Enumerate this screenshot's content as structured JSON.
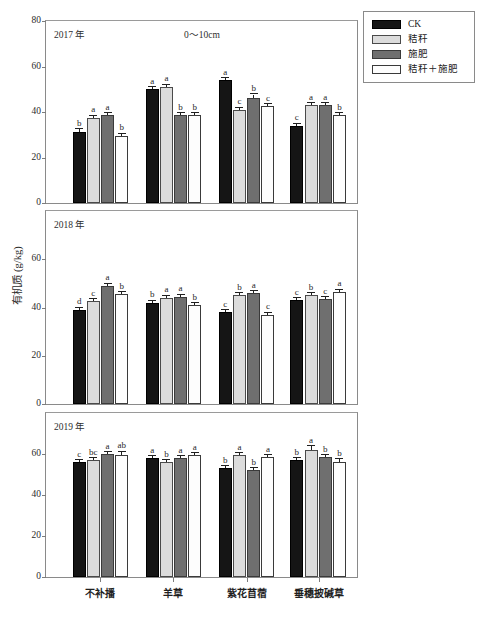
{
  "figure": {
    "ylabel": "有机质 (g/kg)",
    "depth_label": "0～10cm",
    "caption": ""
  },
  "legend": {
    "position": "top-right",
    "items": [
      {
        "label": "CK",
        "swatch": "ck",
        "color": "#151515"
      },
      {
        "label": "秸秆",
        "swatch": "straw",
        "color": "#dcdcdc"
      },
      {
        "label": "施肥",
        "swatch": "fert",
        "color": "#6f6f6f"
      },
      {
        "label": "秸秆＋施肥",
        "swatch": "both",
        "color": "#fdfdfd"
      }
    ]
  },
  "axis": {
    "yticks": [
      "0",
      "20",
      "40",
      "60",
      "80"
    ],
    "ytick_values": [
      0,
      20,
      40,
      60,
      80
    ],
    "ylim": [
      0,
      80
    ],
    "xcategories": [
      "不补播",
      "羊草",
      "紫花苜蓿",
      "垂穗披碱草"
    ]
  },
  "panels": [
    {
      "year": "2017 年",
      "show_80_tick": true
    },
    {
      "year": "2018 年",
      "show_80_tick": false
    },
    {
      "year": "2019 年",
      "show_80_tick": false
    }
  ],
  "chart_data": {
    "type": "bar",
    "title": "0～10cm",
    "xlabel": "",
    "ylabel": "有机质 (g/kg)",
    "ylim": [
      0,
      80
    ],
    "yticks": [
      0,
      20,
      40,
      60,
      80
    ],
    "grid": false,
    "legend_position": "top-right",
    "categories": [
      "不补播",
      "羊草",
      "紫花苜蓿",
      "垂穗披碱草"
    ],
    "panels": [
      {
        "label": "2017 年",
        "series": [
          {
            "name": "CK",
            "values": [
              31.0,
              50.0,
              54.0,
              34.0
            ],
            "errors": [
              1.4,
              0.8,
              0.5,
              0.9
            ],
            "letters": [
              "b",
              "a",
              "a",
              "c"
            ]
          },
          {
            "name": "秸秆",
            "values": [
              37.5,
              51.0,
              41.0,
              43.0
            ],
            "errors": [
              0.5,
              0.6,
              0.7,
              0.6
            ],
            "letters": [
              "a",
              "a",
              "c",
              "a"
            ]
          },
          {
            "name": "施肥",
            "values": [
              38.5,
              38.5,
              46.0,
              43.0
            ],
            "errors": [
              1.0,
              0.8,
              1.7,
              0.4
            ],
            "letters": [
              "a",
              "b",
              "b",
              "a"
            ]
          },
          {
            "name": "秸秆＋施肥",
            "values": [
              29.5,
              38.5,
              42.5,
              38.5
            ],
            "errors": [
              0.9,
              0.3,
              0.6,
              0.4
            ],
            "letters": [
              "b",
              "b",
              "c",
              "b"
            ]
          }
        ]
      },
      {
        "label": "2018 年",
        "series": [
          {
            "name": "CK",
            "values": [
              39.0,
              42.0,
              38.0,
              43.0
            ],
            "errors": [
              0.4,
              0.9,
              0.5,
              0.4
            ],
            "letters": [
              "d",
              "b",
              "c",
              "c"
            ]
          },
          {
            "name": "秸秆",
            "values": [
              42.5,
              44.0,
              45.0,
              45.0
            ],
            "errors": [
              0.4,
              0.4,
              0.5,
              0.5
            ],
            "letters": [
              "c",
              "a",
              "b",
              "b"
            ]
          },
          {
            "name": "施肥",
            "values": [
              49.0,
              44.5,
              46.0,
              43.5
            ],
            "errors": [
              0.8,
              0.4,
              0.4,
              0.5
            ],
            "letters": [
              "a",
              "a",
              "a",
              "c"
            ]
          },
          {
            "name": "秸秆＋施肥",
            "values": [
              45.5,
              41.0,
              37.0,
              46.5
            ],
            "errors": [
              0.5,
              0.4,
              0.5,
              0.4
            ],
            "letters": [
              "b",
              "b",
              "c",
              "a"
            ]
          }
        ]
      },
      {
        "label": "2019 年",
        "series": [
          {
            "name": "CK",
            "values": [
              56.0,
              58.0,
              53.0,
              57.0
            ],
            "errors": [
              0.5,
              0.5,
              0.7,
              1.0
            ],
            "letters": [
              "c",
              "a",
              "b",
              "b"
            ]
          },
          {
            "name": "秸秆",
            "values": [
              57.0,
              56.0,
              59.5,
              62.0
            ],
            "errors": [
              1.0,
              0.8,
              0.8,
              1.8
            ],
            "letters": [
              "bc",
              "b",
              "a",
              "a"
            ]
          },
          {
            "name": "施肥",
            "values": [
              60.0,
              58.0,
              52.0,
              58.5
            ],
            "errors": [
              0.4,
              0.6,
              0.7,
              0.7
            ],
            "letters": [
              "a",
              "a",
              "b",
              "b"
            ]
          },
          {
            "name": "秸秆＋施肥",
            "values": [
              59.5,
              59.5,
              58.5,
              56.0
            ],
            "errors": [
              1.7,
              0.4,
              0.6,
              1.4
            ],
            "letters": [
              "ab",
              "a",
              "a",
              "b"
            ]
          }
        ]
      }
    ]
  }
}
